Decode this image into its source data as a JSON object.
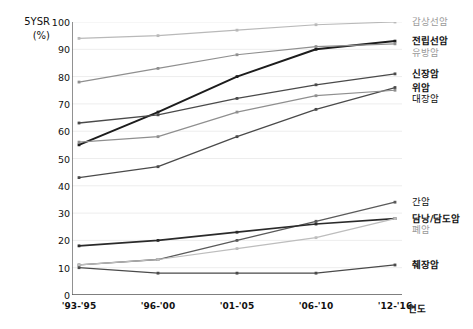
{
  "chart_data": {
    "type": "line",
    "title": "",
    "ylabel": "5YSR (%)",
    "xlabel": "연도",
    "ylim": [
      0,
      100
    ],
    "ytick_labels": [
      "100",
      "90",
      "80",
      "70",
      "60",
      "50",
      "40",
      "30",
      "20",
      "10",
      "0"
    ],
    "ytick_values": [
      100,
      90,
      80,
      70,
      60,
      50,
      40,
      30,
      20,
      10,
      0
    ],
    "categories": [
      "'93-'95",
      "'96-'00",
      "'01-'05",
      "'06-'10",
      "'12-'16"
    ],
    "grid": true,
    "legend_position": "right-of-line-ends",
    "series": [
      {
        "name": "갑상선암",
        "values": [
          94,
          95,
          97,
          99,
          100
        ],
        "color": "#b9b9b9",
        "weight": "dim",
        "width": 1.2
      },
      {
        "name": "전립선암",
        "values": [
          55,
          67,
          80,
          90,
          93
        ],
        "color": "#1c1c1c",
        "weight": "bold",
        "width": 2.0
      },
      {
        "name": "유방암",
        "values": [
          78,
          83,
          88,
          91,
          92
        ],
        "color": "#8f8f8f",
        "weight": "dim",
        "width": 1.2
      },
      {
        "name": "신장암",
        "values": [
          63,
          66,
          72,
          77,
          81
        ],
        "color": "#4a4a4a",
        "weight": "norm",
        "width": 1.3
      },
      {
        "name": "위암",
        "values": [
          43,
          47,
          58,
          68,
          76
        ],
        "color": "#4a4a4a",
        "weight": "norm",
        "width": 1.3
      },
      {
        "name": "대장암",
        "values": [
          56,
          58,
          67,
          73,
          75
        ],
        "color": "#8f8f8f",
        "weight": "norm",
        "width": 1.2
      },
      {
        "name": "간암",
        "values": [
          11,
          13,
          20,
          27,
          34
        ],
        "color": "#5a5a5a",
        "weight": "norm",
        "width": 1.3
      },
      {
        "name": "담낭/담도암",
        "values": [
          18,
          20,
          23,
          26,
          28
        ],
        "color": "#2a2a2a",
        "weight": "bold",
        "width": 1.7
      },
      {
        "name": "폐암",
        "values": [
          11,
          13,
          17,
          21,
          28
        ],
        "color": "#bdbdbd",
        "weight": "dim",
        "width": 1.2
      },
      {
        "name": "췌장암",
        "values": [
          10,
          8,
          8,
          8,
          11
        ],
        "color": "#4a4a4a",
        "weight": "norm",
        "width": 1.3
      }
    ],
    "legend_labels": [
      {
        "text": "갑상선암",
        "style": "dim"
      },
      {
        "text": "전립선암",
        "style": "bold"
      },
      {
        "text": "유방암",
        "style": "dim"
      },
      {
        "text": "신장암",
        "style": "bold"
      },
      {
        "text": "위암",
        "style": "bold"
      },
      {
        "text": "대장암",
        "style": "norm"
      },
      {
        "text": "간암",
        "style": "norm"
      },
      {
        "text": "담낭/담도암",
        "style": "bold"
      },
      {
        "text": "폐암",
        "style": "dim"
      },
      {
        "text": "췌장암",
        "style": "bold"
      }
    ]
  },
  "axis": {
    "y_title_line1": "5YSR",
    "y_title_line2": "(%)",
    "x_title": "연도"
  }
}
